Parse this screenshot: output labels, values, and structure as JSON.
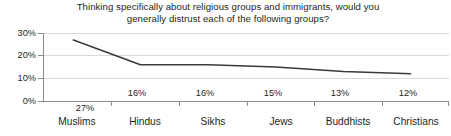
{
  "chart_data": {
    "type": "line",
    "title": "Thinking specifically about religious groups and immigrants, would you generally distrust each of the following groups?",
    "title_lines": [
      "Thinking specifically about religious groups and immigrants, would you",
      "generally distrust each of the following groups?"
    ],
    "xlabel": "",
    "ylabel": "",
    "categories": [
      "Muslims",
      "Hindus",
      "Sikhs",
      "Jews",
      "Buddhists",
      "Christians"
    ],
    "values": [
      27,
      16,
      16,
      15,
      13,
      12
    ],
    "value_labels": [
      "27%",
      "16%",
      "16%",
      "15%",
      "13%",
      "12%"
    ],
    "ylim": [
      0,
      30
    ],
    "yticks": [
      0,
      10,
      20,
      30
    ],
    "ytick_labels": [
      "0%",
      "10%",
      "20%",
      "30%"
    ],
    "grid": true,
    "legend": "none",
    "series_color": "#3a3a3a",
    "grid_color": "#d9d9d9",
    "axis_color": "#8c8c8c",
    "text_color": "#231f20",
    "background": "#ffffff"
  }
}
